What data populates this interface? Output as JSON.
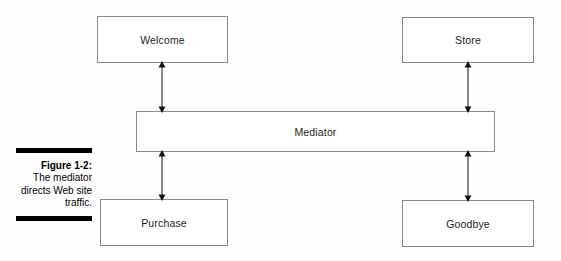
{
  "figure": {
    "number_label": "Figure 1-2:",
    "description": "The mediator directs Web site traffic."
  },
  "diagram": {
    "type": "block-diagram",
    "nodes": [
      {
        "id": "welcome",
        "label": "Welcome"
      },
      {
        "id": "store",
        "label": "Store"
      },
      {
        "id": "mediator",
        "label": "Mediator"
      },
      {
        "id": "purchase",
        "label": "Purchase"
      },
      {
        "id": "goodbye",
        "label": "Goodbye"
      }
    ],
    "connections": [
      {
        "from": "welcome",
        "to": "mediator",
        "style": "double-arrow"
      },
      {
        "from": "store",
        "to": "mediator",
        "style": "double-arrow"
      },
      {
        "from": "mediator",
        "to": "purchase",
        "style": "double-arrow"
      },
      {
        "from": "mediator",
        "to": "goodbye",
        "style": "double-arrow"
      }
    ],
    "colors": {
      "box_border": "#8a8a8a",
      "box_fill": "#ffffff",
      "arrow": "#111111",
      "caption_rule": "#000000",
      "text": "#1d1d1d",
      "background": "#fefefe"
    }
  }
}
